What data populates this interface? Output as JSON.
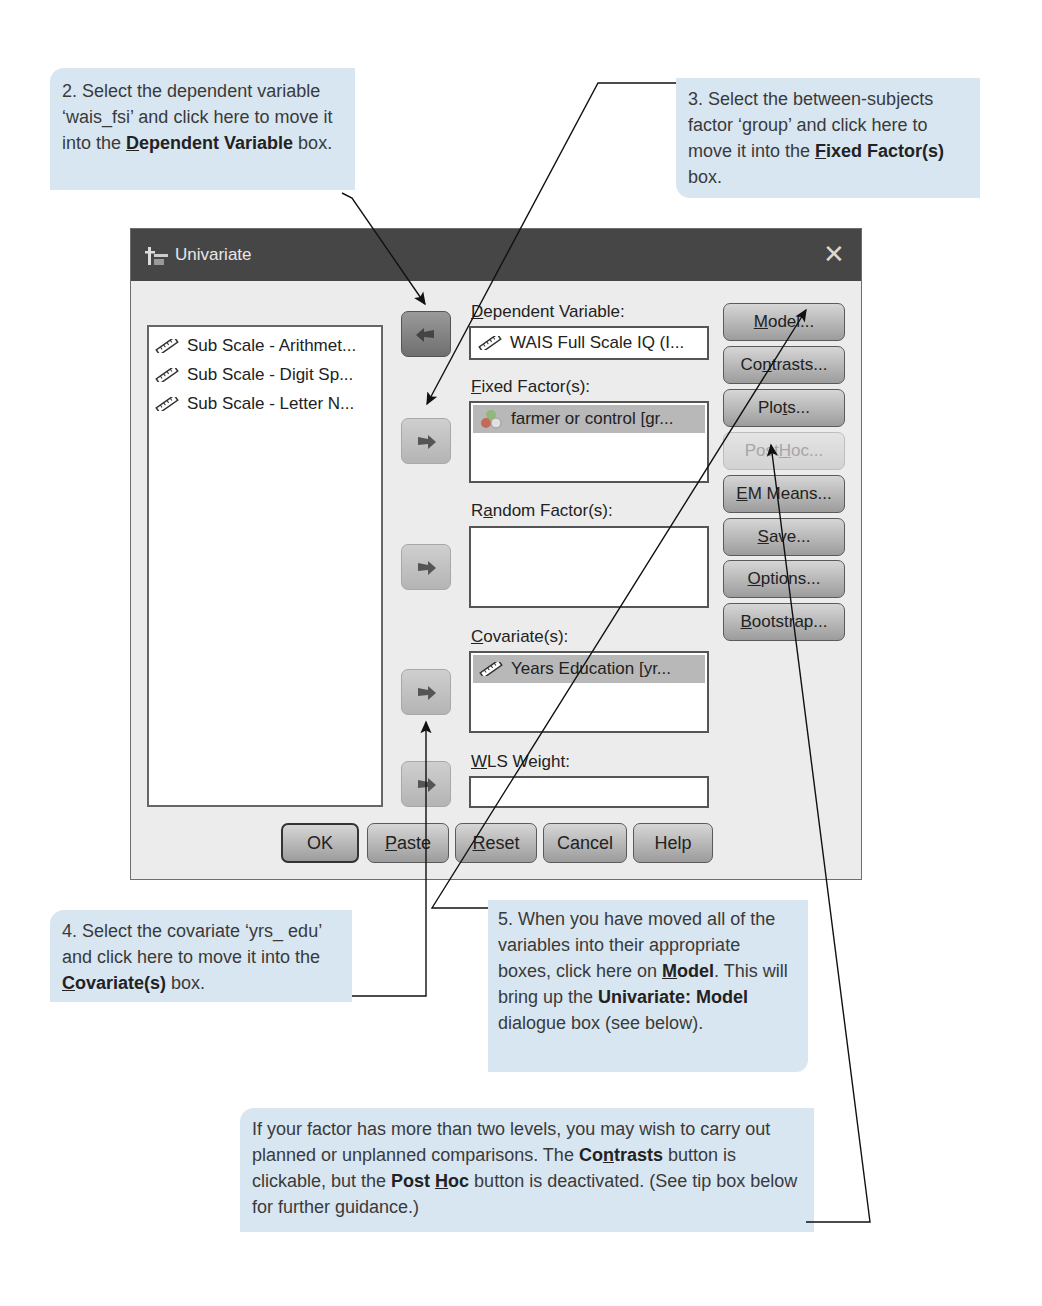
{
  "callouts": {
    "step2": {
      "text_before": "2. Select the dependent variable ‘wais_fsi’ and click here to move it into the ",
      "bold_mnemonic": "D",
      "bold_rest": "ependent Variable",
      "text_after": " box."
    },
    "step3": {
      "text_before": "3. Select the between-subjects factor ‘group’ and click here to move it into the ",
      "bold_mnemonic": "F",
      "bold_rest": "ixed Factor(s)",
      "text_after": " box."
    },
    "step4": {
      "text_before": "4. Select the covariate ‘yrs_ edu’ and click here to move it into the ",
      "bold_mnemonic": "C",
      "bold_rest": "ovariate(s)",
      "text_after": " box."
    },
    "step5": {
      "text_before": "5. When you have moved all of the variables into their appropriate boxes, click here on ",
      "bold_mnemonic": "M",
      "bold_rest": "odel",
      "text_mid": ". This will bring up the ",
      "bold2": "Univariate: Model",
      "text_after": " dialogue box (see below)."
    },
    "tip": {
      "text_before": "If your factor has more than two levels, you may wish to carry out planned or unplanned comparisons. The ",
      "bold1_a": "Co",
      "bold1_mnemonic": "n",
      "bold1_b": "trasts",
      "text_mid": " button is clickable, but the ",
      "bold2_a": "Post ",
      "bold2_mnemonic": "H",
      "bold2_b": "oc",
      "text_after": " button is deactivated. (See tip box below for further guidance.)"
    }
  },
  "dialog": {
    "title": "Univariate",
    "close_glyph": "✕",
    "source_variables": [
      {
        "label": "Sub Scale - Arithmet...",
        "icon": "scale-ruler-icon"
      },
      {
        "label": "Sub Scale - Digit Sp...",
        "icon": "scale-ruler-icon"
      },
      {
        "label": "Sub Scale - Letter N...",
        "icon": "scale-ruler-icon"
      }
    ],
    "targets": {
      "dependent": {
        "mnemonic": "D",
        "rest": "ependent Variable:",
        "value": "WAIS Full Scale IQ (I...",
        "icon": "scale-ruler-icon"
      },
      "fixed": {
        "mnemonic": "F",
        "rest": "ixed Factor(s):",
        "items": [
          "farmer or control [gr..."
        ],
        "icon": "nominal-circles-icon"
      },
      "random": {
        "pre": "R",
        "mnemonic": "a",
        "rest": "ndom Factor(s):",
        "items": []
      },
      "covariates": {
        "mnemonic": "C",
        "rest": "ovariate(s):",
        "items": [
          "Years Education [yr..."
        ],
        "icon": "scale-ruler-icon"
      },
      "wls": {
        "mnemonic": "W",
        "rest": "LS Weight:",
        "value": ""
      }
    },
    "side_buttons": [
      {
        "pre": "",
        "mnemonic": "M",
        "post": "odel...",
        "enabled": true
      },
      {
        "pre": "Co",
        "mnemonic": "n",
        "post": "trasts...",
        "enabled": true
      },
      {
        "pre": "Plo",
        "mnemonic": "t",
        "post": "s...",
        "enabled": true
      },
      {
        "pre": "Post ",
        "mnemonic": "H",
        "post": "oc...",
        "enabled": false
      },
      {
        "pre": "",
        "mnemonic": "E",
        "post": "M Means...",
        "enabled": true
      },
      {
        "pre": "",
        "mnemonic": "S",
        "post": "ave...",
        "enabled": true
      },
      {
        "pre": "",
        "mnemonic": "O",
        "post": "ptions...",
        "enabled": true
      },
      {
        "pre": "",
        "mnemonic": "B",
        "post": "ootstrap...",
        "enabled": true
      }
    ],
    "bottom_buttons": [
      {
        "pre": "OK",
        "mnemonic": "",
        "post": ""
      },
      {
        "pre": "",
        "mnemonic": "P",
        "post": "aste"
      },
      {
        "pre": "",
        "mnemonic": "R",
        "post": "eset"
      },
      {
        "pre": "Cancel",
        "mnemonic": "",
        "post": ""
      },
      {
        "pre": "Help",
        "mnemonic": "",
        "post": ""
      }
    ]
  }
}
